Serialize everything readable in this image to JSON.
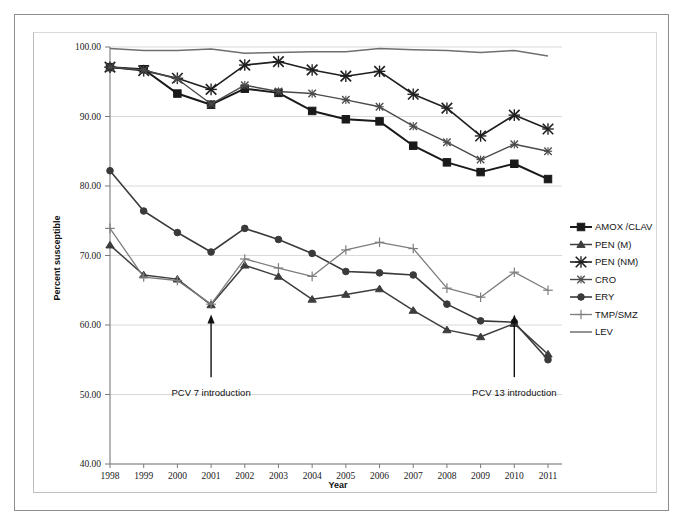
{
  "figure": {
    "background_color": "#ffffff",
    "frame_color": "#8d8d8d",
    "plot_frame_color": "#bdbdbd"
  },
  "chart_data": {
    "type": "line",
    "title": "",
    "xlabel": "Year",
    "ylabel": "Percent susceptible",
    "x": [
      1998,
      1999,
      2000,
      2001,
      2002,
      2003,
      2004,
      2005,
      2006,
      2007,
      2008,
      2009,
      2010,
      2011
    ],
    "categories": [
      "1998",
      "1999",
      "2000",
      "2001",
      "2002",
      "2003",
      "2004",
      "2005",
      "2006",
      "2007",
      "2008",
      "2009",
      "2010",
      "2011"
    ],
    "xlim": [
      1998,
      2011
    ],
    "ylim": [
      40.0,
      100.0
    ],
    "yticks": [
      40.0,
      50.0,
      60.0,
      70.0,
      80.0,
      90.0,
      100.0
    ],
    "ytick_labels": [
      "40.00",
      "50.00",
      "60.00",
      "70.00",
      "80.00",
      "90.00",
      "100.00"
    ],
    "grid": "horizontal",
    "legend_position": "right",
    "series": [
      {
        "name": "AMOX /CLAV",
        "marker": "square",
        "color": "#1a1a1a",
        "line_width": 2.0,
        "marker_size": 5.6,
        "values": [
          97.1,
          96.8,
          93.3,
          91.7,
          94.0,
          93.4,
          90.8,
          89.6,
          89.3,
          85.8,
          83.4,
          82.0,
          83.2,
          81.0
        ]
      },
      {
        "name": "PEN (M)",
        "marker": "triangle",
        "color": "#3d3d3d",
        "line_width": 1.5,
        "marker_size": 4.6,
        "values": [
          71.5,
          67.2,
          66.6,
          62.9,
          68.6,
          67.0,
          63.7,
          64.4,
          65.2,
          62.1,
          59.3,
          58.3,
          60.2,
          55.8
        ]
      },
      {
        "name": "PEN (NM)",
        "marker": "x",
        "color": "#1f1f1f",
        "line_width": 1.6,
        "marker_size": 5.0,
        "values": [
          97.1,
          96.6,
          95.5,
          93.9,
          97.4,
          97.9,
          96.7,
          95.8,
          96.5,
          93.2,
          91.2,
          87.2,
          90.2,
          88.2
        ]
      },
      {
        "name": "CRO",
        "marker": "x-small",
        "color": "#4a4a4a",
        "line_width": 1.4,
        "marker_size": 4.4,
        "values": [
          97.1,
          96.7,
          95.4,
          91.8,
          94.5,
          93.6,
          93.3,
          92.4,
          91.4,
          88.6,
          86.3,
          83.8,
          86.0,
          85.0
        ]
      },
      {
        "name": "ERY",
        "marker": "circle",
        "color": "#3a3a3a",
        "line_width": 1.6,
        "marker_size": 4.6,
        "values": [
          82.2,
          76.4,
          73.3,
          70.5,
          73.9,
          72.3,
          70.3,
          67.7,
          67.5,
          67.2,
          63.0,
          60.6,
          60.4,
          55.0
        ]
      },
      {
        "name": "TMP/SMZ",
        "marker": "plus",
        "color": "#7d7d7d",
        "line_width": 1.3,
        "marker_size": 4.8,
        "values": [
          73.9,
          66.9,
          66.4,
          63.0,
          69.5,
          68.2,
          67.0,
          70.8,
          71.9,
          71.0,
          65.3,
          64.0,
          67.6,
          65.0
        ]
      },
      {
        "name": "LEV",
        "marker": "none",
        "color": "#6f6f6f",
        "line_width": 1.5,
        "marker_size": 0,
        "values": [
          99.8,
          99.5,
          99.5,
          99.7,
          99.1,
          99.2,
          99.3,
          99.3,
          99.8,
          99.6,
          99.5,
          99.2,
          99.5,
          98.7
        ]
      }
    ],
    "annotations": [
      {
        "text": "PCV 7 introduction",
        "x_year": 2001,
        "arrow_from_y": 52.5,
        "arrow_to_y": 61.5
      },
      {
        "text": "PCV 13 introduction",
        "x_year": 2010,
        "arrow_from_y": 52.5,
        "arrow_to_y": 61.5
      }
    ]
  }
}
